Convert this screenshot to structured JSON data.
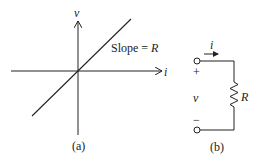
{
  "figure_a": {
    "y_axis_label": "v",
    "x_axis_label": "i",
    "line_label_prefix": "Slope = ",
    "line_label_var": "R",
    "caption": "(a)"
  },
  "figure_b": {
    "current_label": "i",
    "plus_label": "+",
    "voltage_label": "v",
    "minus_label": "−",
    "resistor_label": "R",
    "caption": "(b)"
  },
  "colors": {
    "stroke": "#222222",
    "background": "#ffffff"
  }
}
